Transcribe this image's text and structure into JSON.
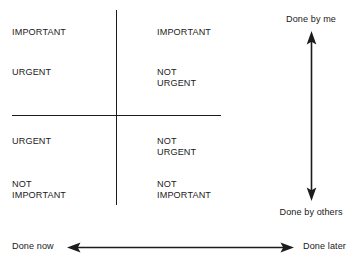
{
  "diagram": {
    "line_color": "#1c1c1c",
    "text_color": "#1a1a1a",
    "background_color": "#ffffff"
  },
  "quadrants": [
    {
      "id": "top-left",
      "primary": "IMPORTANT",
      "secondary": "URGENT"
    },
    {
      "id": "top-right",
      "primary": "IMPORTANT",
      "secondary": "NOT\nURGENT"
    },
    {
      "id": "bottom-left",
      "primary": "URGENT",
      "secondary": "NOT\nIMPORTANT"
    },
    {
      "id": "bottom-right",
      "primary": "NOT\nURGENT",
      "secondary": "NOT\nIMPORTANT"
    }
  ],
  "vertical_axis": {
    "top_label": "Done by me",
    "bottom_label": "Done by others"
  },
  "horizontal_axis": {
    "left_label": "Done now",
    "right_label": "Done later"
  }
}
